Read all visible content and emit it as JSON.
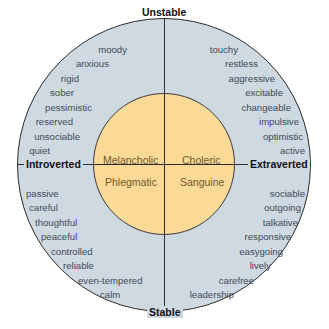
{
  "diagram": {
    "axes": {
      "top": "Unstable",
      "bottom": "Stable",
      "left": "Introverted",
      "right": "Extraverted"
    },
    "temperaments": {
      "top_left": "Melancholic",
      "top_right": "Choleric",
      "bottom_left": "Phlegmatic",
      "bottom_right": "Sanguine"
    },
    "traits": {
      "unstable_introverted": [
        "moody",
        "anxious",
        "rigid",
        "sober",
        "pessimistic",
        "reserved",
        "unsociable",
        "quiet"
      ],
      "unstable_extraverted": [
        "touchy",
        "restless",
        "aggressive",
        "excitable",
        "changeable",
        "impulsive",
        "optimistic",
        "active"
      ],
      "stable_introverted": [
        "passive",
        "careful",
        "thoughtful",
        "peaceful",
        "controlled",
        "reliable",
        "even-tempered",
        "calm"
      ],
      "stable_extraverted": [
        "sociable",
        "outgoing",
        "talkative",
        "responsive",
        "easygoing",
        "lively",
        "carefree",
        "leadership"
      ]
    },
    "colors": {
      "outer_ring": "#cfd9e2",
      "inner_circle": "#fbd996",
      "lines": "#2a2a2a",
      "trait_text": "#3f4a58",
      "temperament_text": "#6b5a2e"
    }
  }
}
